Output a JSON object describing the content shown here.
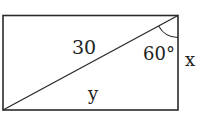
{
  "diagram": {
    "type": "rectangle-with-diagonal",
    "labels": {
      "diagonal": "30",
      "angle": "60°",
      "side_right": "x",
      "side_bottom": "y"
    },
    "colors": {
      "line": "#2a2a2a",
      "text": "#222222",
      "background": "#ffffff"
    }
  }
}
